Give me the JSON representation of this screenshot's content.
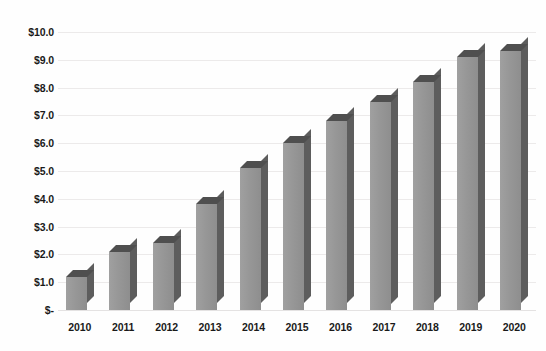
{
  "chart_data": {
    "type": "bar",
    "title": "",
    "subtitle": "",
    "xlabel": "",
    "ylabel": "",
    "categories": [
      "2010",
      "2011",
      "2012",
      "2013",
      "2014",
      "2015",
      "2016",
      "2017",
      "2018",
      "2019",
      "2020"
    ],
    "values": [
      1.2,
      2.1,
      2.4,
      3.8,
      5.1,
      6.0,
      6.8,
      7.5,
      8.2,
      9.1,
      9.3
    ],
    "series": [
      {
        "name": "",
        "values": [
          1.2,
          2.1,
          2.4,
          3.8,
          5.1,
          6.0,
          6.8,
          7.5,
          8.2,
          9.1,
          9.3
        ]
      }
    ],
    "ylim": [
      0,
      10
    ],
    "y_ticks": [
      0,
      1,
      2,
      3,
      4,
      5,
      6,
      7,
      8,
      9,
      10
    ],
    "y_tick_labels": [
      "$-",
      "$1.0",
      "$2.0",
      "$3.0",
      "$4.0",
      "$5.0",
      "$6.0",
      "$7.0",
      "$8.0",
      "$9.0",
      "$10.0"
    ],
    "x_tick_labels": [
      "2010",
      "2011",
      "2012",
      "2013",
      "2014",
      "2015",
      "2016",
      "2017",
      "2018",
      "2019",
      "2020"
    ],
    "grid": true,
    "grid_axis": "y",
    "legend": false,
    "legend_position": "none",
    "annotations": [],
    "bar_style": "3d-column",
    "colors": {
      "bar_front": "#979797",
      "bar_side": "#5d5d5d",
      "bar_top": "#4f4f4f",
      "gridline": "#eceaea",
      "background": "#fefefe",
      "tick_label": "#1a1a1a"
    }
  }
}
